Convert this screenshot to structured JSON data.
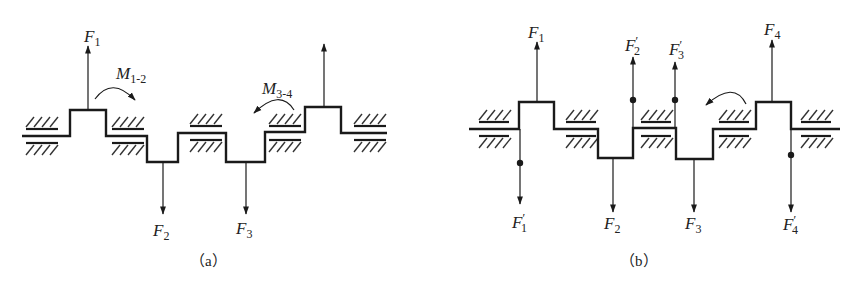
{
  "figure": {
    "panel_a": {
      "caption": "（a）",
      "labels": {
        "F1": {
          "main": "F",
          "sub": "1",
          "prime": ""
        },
        "F2": {
          "main": "F",
          "sub": "2",
          "prime": ""
        },
        "F3": {
          "main": "F",
          "sub": "3",
          "prime": ""
        },
        "M12": {
          "main": "M",
          "sub": "1-2"
        },
        "M34": {
          "main": "M",
          "sub": "3-4"
        }
      }
    },
    "panel_b": {
      "caption": "（b）",
      "labels": {
        "F1": {
          "main": "F",
          "sub": "1",
          "prime": ""
        },
        "F1p": {
          "main": "F",
          "sub": "1",
          "prime": "′"
        },
        "F2": {
          "main": "F",
          "sub": "2",
          "prime": ""
        },
        "F2p": {
          "main": "F",
          "sub": "2",
          "prime": "′"
        },
        "F3": {
          "main": "F",
          "sub": "3",
          "prime": ""
        },
        "F3p": {
          "main": "F",
          "sub": "3",
          "prime": "′"
        },
        "F4": {
          "main": "F",
          "sub": "4",
          "prime": ""
        },
        "F4p": {
          "main": "F",
          "sub": "4",
          "prime": "′"
        }
      }
    },
    "colors": {
      "line": "#1a1a1a",
      "background": "#ffffff"
    }
  }
}
